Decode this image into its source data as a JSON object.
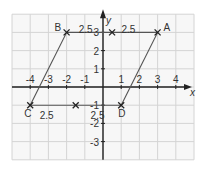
{
  "diagram": {
    "type": "coordinate-grid-parallelogram",
    "grid": {
      "xmin": -5,
      "xmax": 5,
      "ymin": -4,
      "ymax": 4,
      "unit_px": 18.2,
      "origin_px": [
        103,
        87
      ],
      "grid_color": "#d4d4d4",
      "axis_color": "#222222"
    },
    "axes": {
      "x_label": "x",
      "y_label": "y",
      "x_ticks": [
        {
          "value": -4,
          "label": "-4"
        },
        {
          "value": -3,
          "label": "-3"
        },
        {
          "value": -2,
          "label": "-2"
        },
        {
          "value": -1,
          "label": "-1"
        },
        {
          "value": 1,
          "label": "1"
        },
        {
          "value": 2,
          "label": "2"
        },
        {
          "value": 3,
          "label": "3"
        },
        {
          "value": 4,
          "label": "4"
        }
      ],
      "y_ticks": [
        {
          "value": 3,
          "label": "3"
        },
        {
          "value": 2,
          "label": "2"
        },
        {
          "value": 1,
          "label": "1"
        },
        {
          "value": -1,
          "label": "-1"
        },
        {
          "value": -2,
          "label": "-2"
        },
        {
          "value": -3,
          "label": "-3"
        }
      ]
    },
    "points": [
      {
        "name": "A",
        "x": 3,
        "y": 3,
        "label": "A"
      },
      {
        "name": "B",
        "x": -2,
        "y": 3,
        "label": "B"
      },
      {
        "name": "C",
        "x": -4,
        "y": -1,
        "label": "C"
      },
      {
        "name": "D",
        "x": 1,
        "y": -1,
        "label": "D"
      }
    ],
    "midpoint_marks": [
      {
        "x": 0.5,
        "y": 3
      },
      {
        "x": -1.5,
        "y": -1
      }
    ],
    "segment_labels": [
      {
        "text": "2.5",
        "x": -0.95,
        "y": 3.2
      },
      {
        "text": "2.5",
        "x": 1.4,
        "y": 3.2
      },
      {
        "text": "2.5",
        "x": -3.1,
        "y": -1.55
      },
      {
        "text": "2.5",
        "x": -0.3,
        "y": -1.55
      }
    ],
    "line_color": "#555555"
  }
}
